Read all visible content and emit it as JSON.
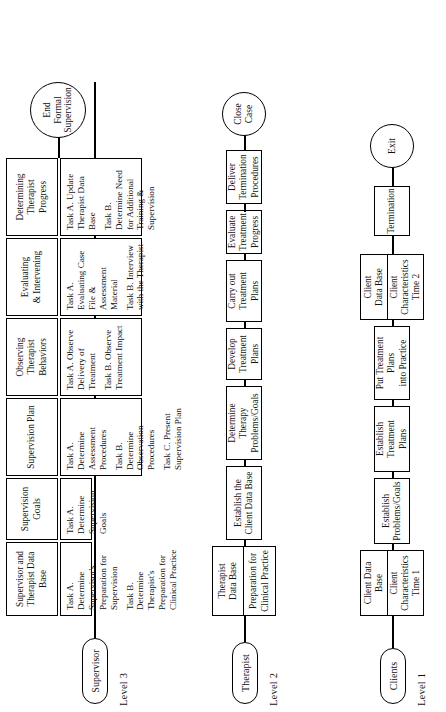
{
  "diagram": {
    "orientation": "rotated-90-ccw",
    "ink_color": "#000000",
    "paper_color": "#ffffff"
  },
  "levels": [
    {
      "id": "level-3",
      "level_label": "Level 3",
      "actor": "Supervisor",
      "terminator": "End\nFormal\nSupervision",
      "terminator_lines": [
        "End",
        "Formal",
        "Supervision"
      ],
      "stages": [
        {
          "phase_lines": [
            "Supervisor and",
            "Therapist Data Base"
          ],
          "tasks": [
            "Task A.  Determine Supervisor's Preparation for Supervision",
            "Task B.  Determine Therapist's Preparation for Clinical Practice"
          ]
        },
        {
          "phase_lines": [
            "Supervision Goals"
          ],
          "tasks": [
            "Task A.  Determine Supervision Goals"
          ]
        },
        {
          "phase_lines": [
            "Supervision Plan"
          ],
          "tasks": [
            "Task A.  Determine Assessment Procedures",
            "Task B.  Determine Observation Procedures",
            "Task C.  Present Supervision Plan"
          ]
        },
        {
          "phase_lines": [
            "Observing",
            "Therapist",
            "Behaviors"
          ],
          "tasks": [
            "Task A.  Observe Delivery of Treatment",
            "Task B.  Observe Treatment Impact"
          ]
        },
        {
          "phase_lines": [
            "Evaluating",
            "& Intervening"
          ],
          "tasks": [
            "Task A.  Evaluating Case File & Assessment Material",
            "Task B.  Interview with the Therapist"
          ]
        },
        {
          "phase_lines": [
            "Determining",
            "Therapist",
            "Progress"
          ],
          "tasks": [
            "Task A.  Update Therapist Data Base",
            "Task B.  Determine Need for Additional Training & Supervision"
          ]
        }
      ]
    },
    {
      "id": "level-2",
      "level_label": "Level 2",
      "actor": "Therapist",
      "terminator_lines": [
        "Close",
        "Case"
      ],
      "nodes": [
        {
          "kind": "split",
          "top_lines": [
            "Therapist",
            "Data Base"
          ],
          "bottom_lines": [
            "Preparation for",
            "Clinical Practice"
          ]
        },
        {
          "kind": "box",
          "lines": [
            "Establish the",
            "Client Data Base"
          ]
        },
        {
          "kind": "box",
          "lines": [
            "Determine Therapy",
            "Problems/Goals"
          ]
        },
        {
          "kind": "box",
          "lines": [
            "Develop",
            "Treatment",
            "Plans"
          ]
        },
        {
          "kind": "box",
          "lines": [
            "Carry out",
            "Treatment Plans"
          ]
        },
        {
          "kind": "box",
          "lines": [
            "Evaluate",
            "Treatment",
            "Progress"
          ]
        },
        {
          "kind": "box",
          "lines": [
            "Deliver",
            "Termination",
            "Procedures"
          ]
        }
      ]
    },
    {
      "id": "level-1",
      "level_label": "Level 1",
      "actor": "Clients",
      "terminator_lines": [
        "Exit"
      ],
      "nodes": [
        {
          "kind": "split",
          "top_lines": [
            "Client Data",
            "Base"
          ],
          "bottom_lines": [
            "Client",
            "Characteristics",
            "Time 1"
          ]
        },
        {
          "kind": "box",
          "lines": [
            "Establish",
            "Problems/Goals"
          ]
        },
        {
          "kind": "box",
          "lines": [
            "Establish",
            "Treatment Plans"
          ]
        },
        {
          "kind": "box",
          "lines": [
            "Put Treatment Plans",
            "into Practice"
          ]
        },
        {
          "kind": "split",
          "top_lines": [
            "Client",
            "Data Base"
          ],
          "bottom_lines": [
            "Client",
            "Characteristics",
            "Time 2"
          ]
        },
        {
          "kind": "box",
          "lines": [
            "Termination"
          ]
        }
      ]
    }
  ]
}
